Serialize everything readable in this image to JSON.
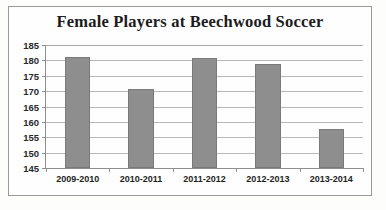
{
  "chart_data": {
    "type": "bar",
    "title": "Female Players at Beechwood Soccer",
    "xlabel": "",
    "ylabel": "",
    "categories": [
      "2009-2010",
      "2010-2011",
      "2011-2012",
      "2012-2013",
      "2013-2014"
    ],
    "values": [
      181,
      170.7,
      180.7,
      178.7,
      157.7
    ],
    "ylim": [
      145,
      185
    ],
    "ytick_step": 5,
    "yticks": [
      185,
      180,
      175,
      170,
      165,
      160,
      155,
      150,
      145
    ],
    "ytick_labels": [
      "185",
      "180",
      "175",
      "170",
      "165",
      "160",
      "155",
      "150",
      "145"
    ],
    "grid": true,
    "legend": false,
    "legend_position": "none",
    "series": [
      {
        "name": "Female Players",
        "values": [
          181,
          170.7,
          180.7,
          178.7,
          157.7
        ]
      }
    ],
    "colors": {
      "bar_fill": "#8e8e8e",
      "bar_border": "#7a7a7a",
      "gridline": "#b9b9b9",
      "axis": "#8e8e8e",
      "title_text": "#1c1c1c",
      "tick_text": "#2a2a2a",
      "frame_border": "#9a9a9a",
      "plot_background": "#fefefe",
      "page_background": "#fdfdfc"
    }
  }
}
